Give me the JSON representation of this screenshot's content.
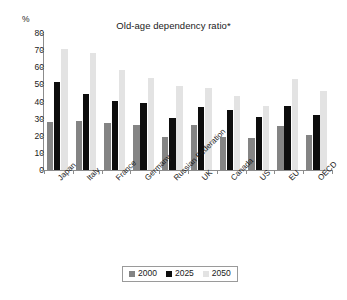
{
  "chart_data": {
    "type": "bar",
    "title": "Old-age dependency ratio*",
    "xlabel": "",
    "ylabel": "%",
    "ylim": [
      0,
      80
    ],
    "ytick_step": 10,
    "yticks": [
      0,
      10,
      20,
      30,
      40,
      50,
      60,
      70,
      80
    ],
    "grid": false,
    "legend_position": "bottom-center",
    "categories": [
      "Japan",
      "Italy",
      "France",
      "Germany",
      "Russian Federation",
      "UK",
      "Canada",
      "US",
      "EU",
      "OECD"
    ],
    "series": [
      {
        "name": "2000",
        "color": "#848484",
        "values": [
          28.0,
          28.7,
          27.6,
          26.4,
          19.4,
          26.0,
          19.0,
          18.8,
          25.7,
          20.6
        ]
      },
      {
        "name": "2025",
        "color": "#0d0d0d",
        "values": [
          51.6,
          44.6,
          40.4,
          39.2,
          30.2,
          36.9,
          34.8,
          30.8,
          37.6,
          32.3
        ]
      },
      {
        "name": "2050",
        "color": "#e3e3e3",
        "values": [
          70.6,
          68.1,
          58.3,
          54.0,
          49.0,
          47.7,
          43.5,
          37.5,
          53.2,
          46.0
        ]
      }
    ]
  },
  "axes": {
    "y_unit": "%",
    "ytick_labels": [
      "80",
      "70",
      "60",
      "50",
      "40",
      "30",
      "20",
      "10",
      "0"
    ]
  },
  "legend": {
    "entries": [
      {
        "label": "2000",
        "swatch": "legend-swatch-2000"
      },
      {
        "label": "2025",
        "swatch": "legend-swatch-2025"
      },
      {
        "label": "2050",
        "swatch": "legend-swatch-2050"
      }
    ]
  }
}
